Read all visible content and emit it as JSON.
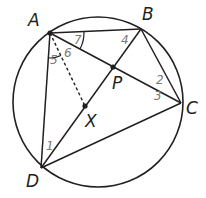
{
  "diagram": {
    "type": "geometry",
    "colors": {
      "line": "#231f20",
      "angle_label": "#7a7a7a",
      "background": "#ffffff"
    },
    "circle": {
      "cx": 98,
      "cy": 102,
      "r": 85
    },
    "points": [
      {
        "name": "A",
        "x": 50,
        "y": 33,
        "label": "A",
        "label_x": 28,
        "label_y": 26,
        "dot": true
      },
      {
        "name": "B",
        "x": 141,
        "y": 29,
        "label": "B",
        "label_x": 142,
        "label_y": 20,
        "dot": false
      },
      {
        "name": "C",
        "x": 181,
        "y": 103,
        "label": "C",
        "label_x": 186,
        "label_y": 114,
        "dot": false
      },
      {
        "name": "D",
        "x": 41,
        "y": 168,
        "label": "D",
        "label_x": 26,
        "label_y": 187,
        "dot": false
      },
      {
        "name": "P",
        "x": 113,
        "y": 67,
        "label": "P",
        "label_x": 112,
        "label_y": 89,
        "dot": true
      },
      {
        "name": "X",
        "x": 85,
        "y": 106,
        "label": "X",
        "label_x": 85,
        "label_y": 127,
        "dot": true
      }
    ],
    "segments": [
      {
        "from": "A",
        "to": "B",
        "style": "solid"
      },
      {
        "from": "B",
        "to": "C",
        "style": "solid"
      },
      {
        "from": "C",
        "to": "D",
        "style": "solid"
      },
      {
        "from": "D",
        "to": "A",
        "style": "solid"
      },
      {
        "from": "A",
        "to": "C",
        "style": "solid"
      },
      {
        "from": "B",
        "to": "D",
        "style": "solid"
      },
      {
        "from": "A",
        "to": "X",
        "style": "dashed"
      }
    ],
    "angle_labels": [
      {
        "text": "1",
        "x": 46,
        "y": 150
      },
      {
        "text": "2",
        "x": 156,
        "y": 84
      },
      {
        "text": "3",
        "x": 154,
        "y": 100
      },
      {
        "text": "4",
        "x": 121,
        "y": 44
      },
      {
        "text": "5",
        "x": 50,
        "y": 64
      },
      {
        "text": "6",
        "x": 64,
        "y": 57
      },
      {
        "text": "7",
        "x": 74,
        "y": 44
      }
    ]
  }
}
